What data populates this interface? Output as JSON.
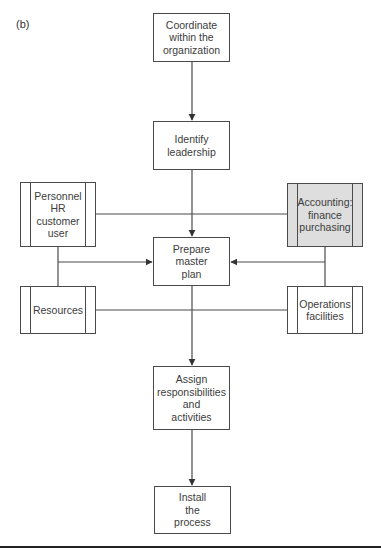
{
  "figure": {
    "panel_label": "(b)"
  },
  "nodes": {
    "coordinate": {
      "label": "Coordinate\nwithin the\norganization",
      "type": "process"
    },
    "identify": {
      "label": "Identify\nleadership",
      "type": "process"
    },
    "personnel": {
      "label": "Personnel\nHR\ncustomer\nuser",
      "type": "predefined"
    },
    "accounting": {
      "label": "Accounting:\nfinance\npurchasing",
      "type": "predefined",
      "fill": "#dedede"
    },
    "prepare": {
      "label": "Prepare\nmaster\nplan",
      "type": "process"
    },
    "resources": {
      "label": "Resources",
      "type": "predefined"
    },
    "operations": {
      "label": "Operations\nfacilities",
      "type": "predefined"
    },
    "assign": {
      "label": "Assign\nresponsibilities\nand\nactivities",
      "type": "process"
    },
    "install": {
      "label": "Install\nthe\nprocess",
      "type": "process"
    }
  },
  "edges": [
    {
      "from": "coordinate",
      "to": "identify",
      "arrow": true
    },
    {
      "from": "identify",
      "to": "prepare",
      "arrow": true
    },
    {
      "from": "personnel",
      "to": "accounting",
      "arrow": false
    },
    {
      "from": "personnel+resources",
      "to": "prepare",
      "arrow": true
    },
    {
      "from": "accounting+operations",
      "to": "prepare",
      "arrow": true
    },
    {
      "from": "resources",
      "to": "operations",
      "arrow": false
    },
    {
      "from": "prepare",
      "to": "assign",
      "arrow": true
    },
    {
      "from": "assign",
      "to": "install",
      "arrow": true
    }
  ],
  "colors": {
    "stroke": "#4a4a4a",
    "shaded_fill": "#dedede",
    "rule": "#222222"
  }
}
